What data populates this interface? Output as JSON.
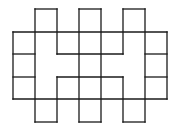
{
  "diagram": {
    "type": "grid-polyomino-net",
    "stroke_color": "#1a1a1a",
    "background": "#ffffff",
    "grid": {
      "x": [
        13,
        35,
        57,
        79,
        101,
        123,
        145,
        167
      ],
      "y": [
        9,
        32,
        54,
        77,
        99,
        122
      ]
    },
    "segments": [
      [
        35,
        9,
        57,
        9
      ],
      [
        79,
        9,
        101,
        9
      ],
      [
        123,
        9,
        145,
        9
      ],
      [
        13,
        32,
        167,
        32
      ],
      [
        13,
        54,
        35,
        54
      ],
      [
        57,
        54,
        123,
        54
      ],
      [
        145,
        54,
        167,
        54
      ],
      [
        13,
        77,
        35,
        77
      ],
      [
        57,
        77,
        123,
        77
      ],
      [
        145,
        77,
        167,
        77
      ],
      [
        13,
        99,
        167,
        99
      ],
      [
        35,
        122,
        57,
        122
      ],
      [
        79,
        122,
        101,
        122
      ],
      [
        123,
        122,
        145,
        122
      ],
      [
        13,
        32,
        13,
        99
      ],
      [
        167,
        32,
        167,
        99
      ],
      [
        35,
        9,
        35,
        122
      ],
      [
        57,
        9,
        57,
        54
      ],
      [
        57,
        77,
        57,
        122
      ],
      [
        79,
        9,
        79,
        122
      ],
      [
        101,
        9,
        101,
        122
      ],
      [
        123,
        9,
        123,
        54
      ],
      [
        123,
        77,
        123,
        122
      ],
      [
        145,
        9,
        145,
        122
      ]
    ]
  }
}
